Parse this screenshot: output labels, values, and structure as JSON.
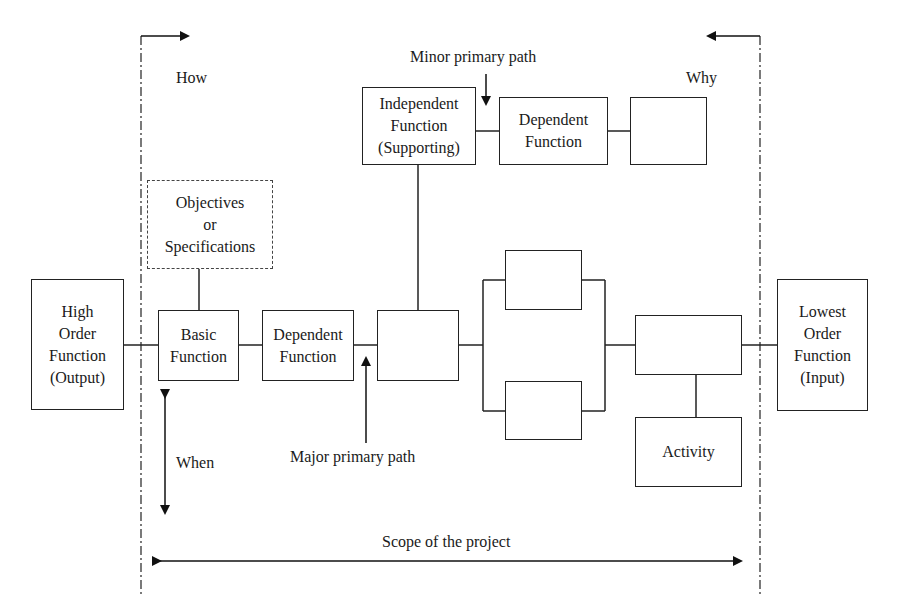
{
  "diagram": {
    "type": "FAST diagram (Function Analysis System Technique)",
    "direction_labels": {
      "how": "How",
      "why": "Why",
      "when": "When"
    },
    "annotations": {
      "minor_primary_path": "Minor primary path",
      "major_primary_path": "Major primary path",
      "scope": "Scope of the project"
    },
    "boxes": {
      "high_order": "High\nOrder\nFunction\n(Output)",
      "objectives": "Objectives\nor\nSpecifications",
      "basic": "Basic\nFunction",
      "dependent_main": "Dependent\nFunction",
      "center": "",
      "independent": "Independent\nFunction\n(Supporting)",
      "dependent_top": "Dependent\nFunction",
      "top_right_empty": "",
      "parallel_top": "",
      "parallel_bottom": "",
      "right_main": "",
      "activity": "Activity",
      "lowest_order": "Lowest\nOrder\nFunction\n(Input)"
    }
  }
}
